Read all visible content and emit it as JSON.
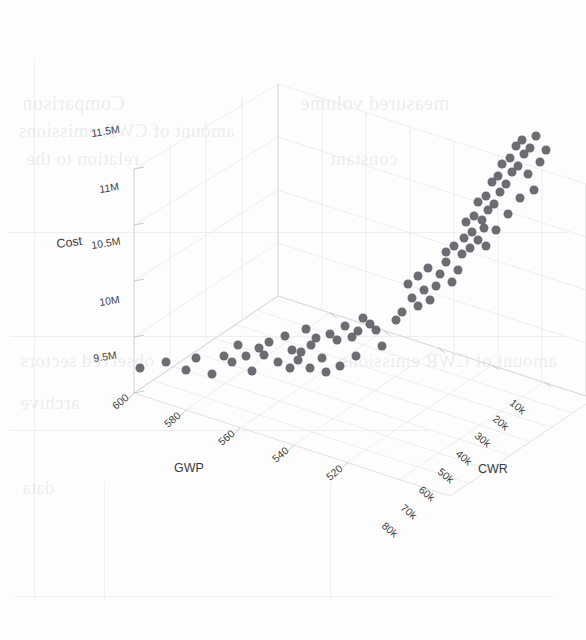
{
  "figure": {
    "kind": "3d-scatter-plot",
    "background_color": "#fdfdfd",
    "marker_color": "#585860",
    "grid_color": "#d9d9de"
  },
  "axes": {
    "x": {
      "name": "GWP",
      "title": "GWP",
      "ticks": [
        "600",
        "580",
        "560",
        "540",
        "520"
      ],
      "tick_values": [
        600,
        580,
        560,
        540,
        520
      ],
      "range": [
        510,
        610
      ]
    },
    "y": {
      "name": "CWR",
      "title": "CWR",
      "ticks": [
        "10k",
        "20k",
        "30k",
        "40k",
        "50k",
        "60k",
        "70k",
        "80k"
      ],
      "tick_values": [
        10000,
        20000,
        30000,
        40000,
        50000,
        60000,
        70000,
        80000
      ],
      "range": [
        5000,
        85000
      ]
    },
    "z": {
      "name": "Cost",
      "title": "Cost",
      "ticks": [
        "11.5M",
        "11M",
        "10.5M",
        "10M",
        "9.5M"
      ],
      "tick_values": [
        11500000,
        11000000,
        10500000,
        10000000,
        9500000
      ],
      "range": [
        9300000,
        11700000
      ]
    }
  },
  "scan_artifacts": {
    "ghost_lines": [
      "Comparison",
      "amount of CWR emissions",
      "relation to the",
      "constant",
      "measured volume",
      "observed sectors",
      "archive",
      "data"
    ]
  },
  "chart_data": {
    "type": "scatter",
    "title": "",
    "xlabel": "GWP",
    "ylabel": "CWR",
    "zlabel": "Cost",
    "xlim": [
      510,
      610
    ],
    "ylim": [
      5000,
      85000
    ],
    "zlim": [
      9300000,
      11700000
    ],
    "grid": true,
    "legend": "none",
    "projection": "3d",
    "n_points": 86,
    "point_color": "#585860",
    "point_size": 9,
    "series": [
      {
        "name": "observations",
        "points_px": [
          [
            140,
            368
          ],
          [
            166,
            362
          ],
          [
            196,
            358
          ],
          [
            224,
            356
          ],
          [
            238,
            345
          ],
          [
            259,
            348
          ],
          [
            269,
            342
          ],
          [
            264,
            355
          ],
          [
            278,
            362
          ],
          [
            285,
            336
          ],
          [
            292,
            350
          ],
          [
            301,
            352
          ],
          [
            306,
            329
          ],
          [
            311,
            345
          ],
          [
            316,
            338
          ],
          [
            322,
            358
          ],
          [
            330,
            334
          ],
          [
            337,
            340
          ],
          [
            345,
            326
          ],
          [
            352,
            337
          ],
          [
            358,
            331
          ],
          [
            363,
            318
          ],
          [
            370,
            324
          ],
          [
            376,
            330
          ],
          [
            310,
            368
          ],
          [
            326,
            372
          ],
          [
            340,
            366
          ],
          [
            252,
            371
          ],
          [
            212,
            374
          ],
          [
            186,
            370
          ],
          [
            232,
            362
          ],
          [
            246,
            356
          ],
          [
            290,
            368
          ],
          [
            298,
            360
          ],
          [
            356,
            356
          ],
          [
            382,
            346
          ],
          [
            396,
            320
          ],
          [
            402,
            312
          ],
          [
            418,
            306
          ],
          [
            412,
            298
          ],
          [
            424,
            290
          ],
          [
            408,
            284
          ],
          [
            430,
            300
          ],
          [
            436,
            286
          ],
          [
            418,
            276
          ],
          [
            428,
            268
          ],
          [
            440,
            274
          ],
          [
            446,
            262
          ],
          [
            452,
            282
          ],
          [
            458,
            270
          ],
          [
            446,
            252
          ],
          [
            454,
            246
          ],
          [
            462,
            254
          ],
          [
            470,
            248
          ],
          [
            464,
            238
          ],
          [
            472,
            232
          ],
          [
            478,
            240
          ],
          [
            484,
            228
          ],
          [
            466,
            222
          ],
          [
            474,
            216
          ],
          [
            482,
            220
          ],
          [
            488,
            210
          ],
          [
            478,
            202
          ],
          [
            486,
            196
          ],
          [
            494,
            204
          ],
          [
            500,
            192
          ],
          [
            492,
            182
          ],
          [
            498,
            176
          ],
          [
            506,
            184
          ],
          [
            512,
            172
          ],
          [
            502,
            164
          ],
          [
            510,
            158
          ],
          [
            518,
            166
          ],
          [
            524,
            154
          ],
          [
            516,
            146
          ],
          [
            522,
            140
          ],
          [
            530,
            148
          ],
          [
            536,
            136
          ],
          [
            528,
            174
          ],
          [
            540,
            162
          ],
          [
            546,
            150
          ],
          [
            534,
            190
          ],
          [
            520,
            198
          ],
          [
            508,
            214
          ],
          [
            496,
            230
          ],
          [
            486,
            246
          ]
        ]
      }
    ]
  }
}
